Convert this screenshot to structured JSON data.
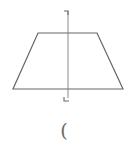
{
  "diagram": {
    "title": "",
    "shape": "isosceles-trapezoid",
    "stroke_color": "#666666",
    "axis_color": "#777777",
    "trapezoid": {
      "top_left": [
        38,
        33
      ],
      "top_right": [
        97,
        33
      ],
      "bottom_right": [
        123,
        89
      ],
      "bottom_left": [
        13,
        89
      ]
    },
    "symmetry_axis": {
      "x": 68,
      "y_start": 11,
      "y_end": 101
    },
    "top_marker": "corner-bracket-top",
    "bottom_marker": "corner-bracket-bottom",
    "caption": "("
  }
}
